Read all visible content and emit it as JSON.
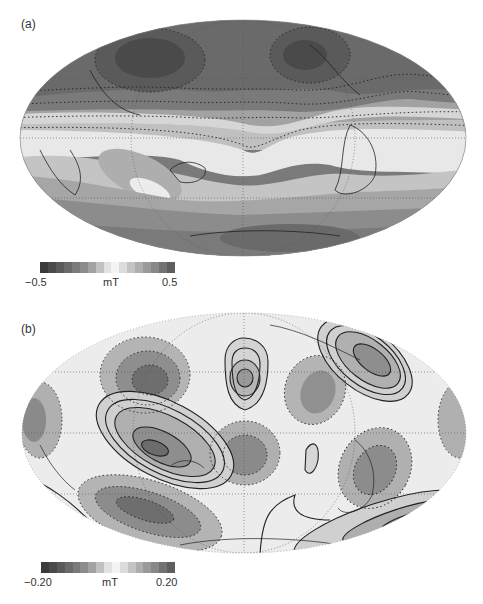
{
  "panels": [
    {
      "label": "(a)",
      "colorbar": {
        "min_label": "−0.5",
        "unit_label": "mT",
        "max_label": "0.5",
        "colors": [
          "#3a3a3a",
          "#4a4a4a",
          "#5a5a5a",
          "#6a6a6a",
          "#7a7a7a",
          "#8c8c8c",
          "#a2a2a2",
          "#c0c0c0",
          "#e2e2e2",
          "#f4f4f4",
          "#dcdcdc",
          "#c4c4c4",
          "#aeaeae",
          "#9a9a9a",
          "#888888",
          "#727272",
          "#5e5e5e"
        ]
      }
    },
    {
      "label": "(b)",
      "colorbar": {
        "min_label": "−0.20",
        "unit_label": "mT",
        "max_label": "0.20",
        "colors": [
          "#3a3a3a",
          "#4a4a4a",
          "#5a5a5a",
          "#6a6a6a",
          "#7a7a7a",
          "#8c8c8c",
          "#a2a2a2",
          "#c0c0c0",
          "#e2e2e2",
          "#f4f4f4",
          "#dcdcdc",
          "#c4c4c4",
          "#aeaeae",
          "#9a9a9a",
          "#888888",
          "#727272",
          "#5e5e5e"
        ]
      }
    }
  ],
  "chart_data": [
    {
      "type": "heatmap",
      "title": "(a)",
      "projection": "Mollweide (Pacific-centered world map)",
      "colorbar": {
        "min": -0.5,
        "max": 0.5,
        "unit": "mT",
        "levels": 16
      },
      "contours": "dotted = negative, solid = positive",
      "features": [
        "strong negative lobes over northern Asia/Pacific and North America",
        "weak/neutral band near equator",
        "positive anomaly south of Africa/Indian Ocean",
        "negative values toward Antarctica"
      ]
    },
    {
      "type": "heatmap",
      "title": "(b)",
      "projection": "Mollweide (Pacific-centered world map)",
      "colorbar": {
        "min": -0.2,
        "max": 0.2,
        "unit": "mT",
        "levels": 16
      },
      "contours": "dotted = negative, solid = positive",
      "features": [
        "alternating positive/negative cells",
        "positive cells over Indonesia, Alaska/N Pacific, N Atlantic, S Atlantic",
        "negative cells over Asia, central Pacific, South America, South Indian Ocean"
      ]
    }
  ]
}
